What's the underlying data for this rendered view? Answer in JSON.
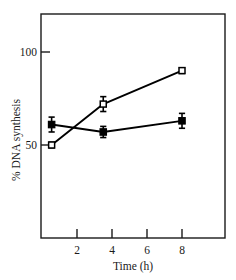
{
  "chart_data": {
    "type": "line",
    "title": "",
    "subtitle": "",
    "xlabel": "Time (h)",
    "ylabel": "% DNA synthesis",
    "xlim": [
      0,
      10.5
    ],
    "ylim": [
      20,
      112
    ],
    "xticks": [
      2,
      4,
      6,
      8
    ],
    "xtick_labels": [
      "2",
      "4",
      "6",
      "8"
    ],
    "yticks": [
      50,
      100
    ],
    "ytick_labels": [
      "50",
      "100"
    ],
    "grid": false,
    "legend": "none",
    "frame": "box",
    "tick_direction": "in",
    "series": [
      {
        "name": "filled-square-series",
        "marker": "filled-square",
        "x": [
          0.55,
          3.5,
          8
        ],
        "values": [
          61,
          57,
          63
        ],
        "yerr": [
          4,
          3,
          4
        ]
      },
      {
        "name": "open-square-series",
        "marker": "open-square",
        "x": [
          0.55,
          3.5,
          8
        ],
        "values": [
          50,
          72,
          90
        ],
        "yerr": [
          1.5,
          4,
          1.5
        ]
      }
    ],
    "colors": {
      "line": "#000000",
      "marker_fill": "#000000",
      "marker_open_fill": "#ffffff",
      "axis": "#1a1a1a",
      "background": "#ffffff"
    }
  },
  "axis": {
    "x_title": "Time (h)",
    "y_title": "% DNA synthesis",
    "ytick_100": "100",
    "ytick_50": "50",
    "xtick_2": "2",
    "xtick_4": "4",
    "xtick_6": "6",
    "xtick_8": "8"
  }
}
